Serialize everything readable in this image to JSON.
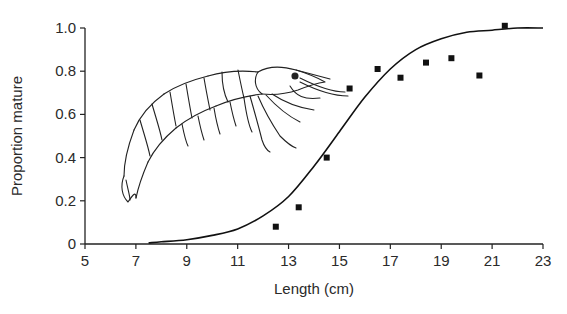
{
  "chart_data": {
    "type": "scatter",
    "title": "",
    "xlabel": "Length (cm)",
    "ylabel": "Proportion mature",
    "xlim": [
      5,
      23
    ],
    "ylim": [
      0,
      1.0
    ],
    "x_ticks": [
      5,
      7,
      9,
      11,
      13,
      15,
      17,
      19,
      21,
      23
    ],
    "y_ticks": [
      "0",
      "0.2",
      "0.4",
      "0.6",
      "0.8",
      "1.0"
    ],
    "grid": false,
    "legend": null,
    "series": [
      {
        "name": "Observed proportion mature",
        "kind": "scatter",
        "marker": "square",
        "x": [
          12.5,
          13.4,
          14.5,
          15.4,
          16.5,
          17.4,
          18.4,
          19.4,
          20.5,
          21.5
        ],
        "y": [
          0.08,
          0.17,
          0.4,
          0.72,
          0.81,
          0.77,
          0.84,
          0.86,
          0.78,
          1.01
        ]
      },
      {
        "name": "Fitted logistic maturity curve",
        "kind": "line",
        "x": [
          7.5,
          8,
          9,
          10,
          11,
          12,
          13,
          14,
          15,
          16,
          17,
          18,
          19,
          20,
          21,
          22,
          23
        ],
        "y": [
          0.005,
          0.01,
          0.02,
          0.04,
          0.07,
          0.13,
          0.22,
          0.36,
          0.52,
          0.68,
          0.81,
          0.9,
          0.95,
          0.98,
          0.99,
          1.0,
          1.0
        ]
      }
    ],
    "annotations": [
      "Line illustration of a shrimp (prawn) in upper-left plot area"
    ]
  }
}
